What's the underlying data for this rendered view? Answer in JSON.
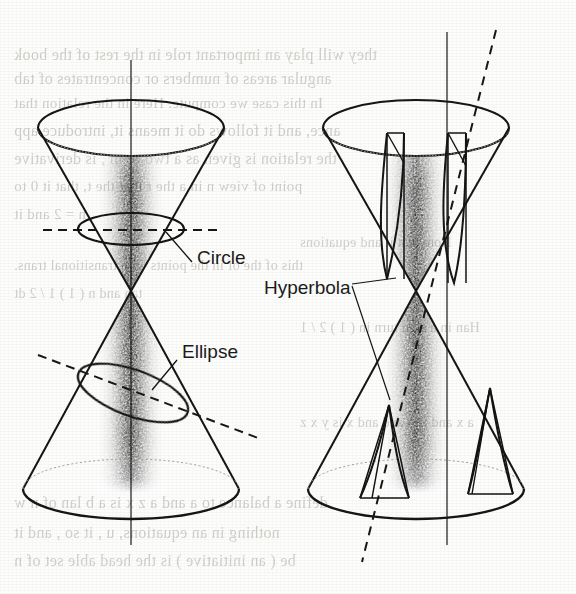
{
  "figure": {
    "caption_labels": [
      {
        "id": "circle",
        "text": "Circle",
        "x": 197,
        "y": 247
      },
      {
        "id": "ellipse",
        "text": "Ellipse",
        "x": 182,
        "y": 341
      },
      {
        "id": "hyperbola",
        "text": "Hyperbola",
        "x": 264,
        "y": 277
      }
    ],
    "diagrams": [
      {
        "id": "left-double-cone",
        "name": "double-cone-circle-ellipse",
        "apex": {
          "x": 131,
          "y": 291
        },
        "axis": {
          "x": 131,
          "y_top": 60,
          "y_bottom": 545
        },
        "upper_cone": {
          "rim_cx": 131,
          "rim_cy": 128,
          "rim_rx": 93,
          "rim_ry": 28
        },
        "lower_cone": {
          "rim_cx": 131,
          "rim_cy": 489,
          "rim_rx": 108,
          "rim_ry": 30
        },
        "sections": [
          {
            "type": "circle",
            "cx": 131,
            "cy": 229,
            "rx": 53,
            "ry": 16,
            "rotation": 0
          },
          {
            "type": "ellipse",
            "cx": 131,
            "cy": 391,
            "rx": 57,
            "ry": 22,
            "rotation": 20
          }
        ],
        "cutting_planes": [
          {
            "type": "horizontal-dashed",
            "x1": 43,
            "y1": 230,
            "x2": 222,
            "y2": 230
          },
          {
            "type": "oblique-dashed",
            "x1": 38,
            "y1": 355,
            "x2": 255,
            "y2": 437
          }
        ]
      },
      {
        "id": "right-double-cone",
        "name": "double-cone-hyperbola",
        "apex": {
          "x": 416,
          "y": 291
        },
        "axis": {
          "x": 447,
          "y_top": 32,
          "y_bottom": 545
        },
        "upper_cone": {
          "rim_cx": 416,
          "rim_cy": 128,
          "rim_rx": 93,
          "rim_ry": 28
        },
        "lower_cone": {
          "rim_cx": 416,
          "rim_cy": 489,
          "rim_rx": 108,
          "rim_ry": 30
        },
        "sections": [
          {
            "type": "hyperbola",
            "branch": "upper-left"
          },
          {
            "type": "hyperbola",
            "branch": "upper-right"
          },
          {
            "type": "hyperbola",
            "branch": "lower-left"
          },
          {
            "type": "hyperbola",
            "branch": "lower-right"
          }
        ],
        "cutting_planes": [
          {
            "type": "oblique-dashed",
            "x1": 495,
            "y1": 30,
            "x2": 362,
            "y2": 562
          }
        ]
      }
    ],
    "colors": {
      "ink": "#131313",
      "paper": "#fdfdfc",
      "shading": "#2a2a2a",
      "bleed_text": "#b9b5ae",
      "dashed": "#161616"
    }
  },
  "bleed_text": {
    "note": "faint show-through text from the reverse side of the scanned page (mirrored)",
    "lines": [
      {
        "text": "they will play an important role in the rest of the book",
        "x": 14,
        "y": 46,
        "size": 16
      },
      {
        "text": "angular areas of numbers or concentrates of tab",
        "x": 14,
        "y": 70,
        "size": 16
      },
      {
        "text": "In this case we compute. Here in the relation that",
        "x": 14,
        "y": 95,
        "size": 15
      },
      {
        "text": "ance, and it follows do it means it, introduce app",
        "x": 14,
        "y": 122,
        "size": 16
      },
      {
        "text": "the relation is given as a two or m , is derivative",
        "x": 14,
        "y": 150,
        "size": 16
      },
      {
        "text": "point of view n in a the r that the t, that it 0 to",
        "x": 14,
        "y": 178,
        "size": 15
      },
      {
        "text": "n = 2 and it",
        "x": 14,
        "y": 206,
        "size": 15
      },
      {
        "text": "this of the of in the points with transitional trans.",
        "x": 14,
        "y": 258,
        "size": 14
      },
      {
        "text": "tan     and    n ( 1 ) 1 / 2 dt",
        "x": 14,
        "y": 286,
        "size": 14
      },
      {
        "text": "define a balance to a and a z x is a b lan of n w",
        "x": 14,
        "y": 494,
        "size": 16
      },
      {
        "text": "nothing in an equations, u , it so , and it",
        "x": 14,
        "y": 524,
        "size": 16
      },
      {
        "text": "be ( an initiative ) is the head able set of n",
        "x": 14,
        "y": 552,
        "size": 16
      },
      {
        "text": "Note that it   and equations",
        "x": 300,
        "y": 235,
        "size": 14
      },
      {
        "text": "Han in a sign turn in ( 1 ) 2 / 1",
        "x": 300,
        "y": 320,
        "size": 14
      },
      {
        "text": "a x and is a and and x is y x z",
        "x": 300,
        "y": 415,
        "size": 14
      }
    ]
  }
}
